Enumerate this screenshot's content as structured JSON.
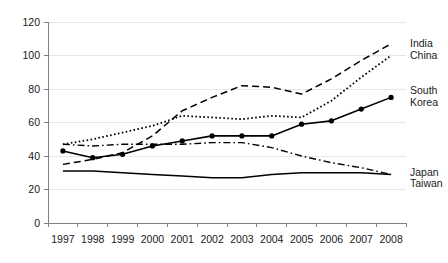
{
  "chart_data": {
    "type": "line",
    "title": "",
    "xlabel": "",
    "ylabel": "",
    "ylim": [
      0,
      120
    ],
    "ytick_step": 20,
    "ytick_labels": [
      "0",
      "20",
      "40",
      "60",
      "80",
      "100",
      "120"
    ],
    "grid": true,
    "legend_position": "right-inline-labels",
    "categories": [
      "1997",
      "1998",
      "1999",
      "2000",
      "2001",
      "2002",
      "2003",
      "2004",
      "2005",
      "2006",
      "2007",
      "2008"
    ],
    "series": [
      {
        "name": "India",
        "style": "dashed",
        "markers": false,
        "color": "#000000",
        "values": [
          35,
          38,
          42,
          52,
          67,
          75,
          82,
          81,
          77,
          86,
          97,
          107
        ]
      },
      {
        "name": "China",
        "style": "dotted",
        "markers": false,
        "color": "#000000",
        "values": [
          47,
          50,
          54,
          58,
          64,
          63,
          62,
          64,
          63,
          73,
          87,
          100
        ]
      },
      {
        "name": "South Korea",
        "style": "solid-markers",
        "markers": true,
        "color": "#000000",
        "values": [
          43,
          39,
          41,
          46,
          49,
          52,
          52,
          52,
          59,
          61,
          68,
          75
        ]
      },
      {
        "name": "Japan",
        "style": "dash-dot",
        "markers": false,
        "color": "#000000",
        "values": [
          47,
          46,
          47,
          47,
          47,
          48,
          48,
          45,
          40,
          36,
          33,
          29
        ]
      },
      {
        "name": "Taiwan",
        "style": "solid",
        "markers": false,
        "color": "#000000",
        "values": [
          31,
          31,
          30,
          29,
          28,
          27,
          27,
          29,
          30,
          30,
          30,
          29
        ]
      }
    ],
    "series_labels": [
      {
        "name": "India",
        "text": "India"
      },
      {
        "name": "China",
        "text": "China"
      },
      {
        "name": "South Korea",
        "text": "South"
      },
      {
        "name": "South Korea 2",
        "text": "Korea"
      },
      {
        "name": "Japan",
        "text": "Japan"
      },
      {
        "name": "Taiwan",
        "text": "Taiwan"
      }
    ]
  }
}
